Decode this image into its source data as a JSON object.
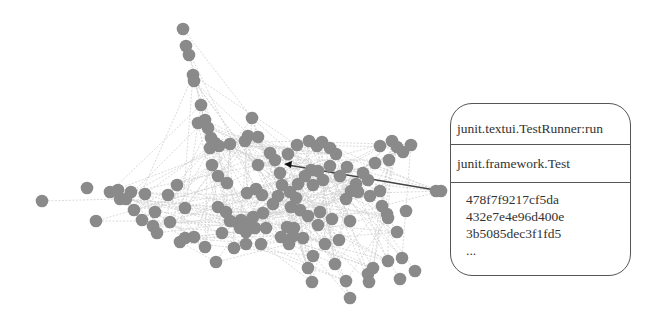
{
  "figure": {
    "node_color": "#8a8a8a",
    "edge_color": "#d0d0d0",
    "highlight_edge_color": "#444444",
    "highlight_edge": {
      "from": [
        441,
        191
      ],
      "to": [
        284,
        164
      ]
    }
  },
  "callout": {
    "method": "junit.textui.TestRunner:run",
    "class": "junit.framework.Test",
    "hashes": [
      "478f7f9217cf5da",
      "432e7e4e96d400e",
      "3b5085dec3f1fd5"
    ],
    "more": "..."
  },
  "nodes": [
    [
      183,
      29
    ],
    [
      186,
      46
    ],
    [
      189,
      55
    ],
    [
      193,
      75
    ],
    [
      194,
      81
    ],
    [
      201,
      105
    ],
    [
      205,
      120
    ],
    [
      208,
      128
    ],
    [
      211,
      138
    ],
    [
      215,
      143
    ],
    [
      219,
      146
    ],
    [
      230,
      144
    ],
    [
      245,
      141
    ],
    [
      248,
      136
    ],
    [
      258,
      137
    ],
    [
      252,
      118
    ],
    [
      198,
      123
    ],
    [
      210,
      148
    ],
    [
      42,
      201
    ],
    [
      87,
      188
    ],
    [
      96,
      221
    ],
    [
      110,
      192
    ],
    [
      118,
      190
    ],
    [
      120,
      199
    ],
    [
      126,
      199
    ],
    [
      131,
      192
    ],
    [
      145,
      194
    ],
    [
      134,
      210
    ],
    [
      177,
      185
    ],
    [
      168,
      195
    ],
    [
      142,
      220
    ],
    [
      155,
      212
    ],
    [
      185,
      208
    ],
    [
      170,
      222
    ],
    [
      180,
      242
    ],
    [
      185,
      238
    ],
    [
      194,
      237
    ],
    [
      218,
      207
    ],
    [
      226,
      212
    ],
    [
      230,
      221
    ],
    [
      241,
      220
    ],
    [
      249,
      222
    ],
    [
      253,
      217
    ],
    [
      246,
      232
    ],
    [
      227,
      183
    ],
    [
      247,
      193
    ],
    [
      256,
      189
    ],
    [
      262,
      195
    ],
    [
      218,
      176
    ],
    [
      212,
      165
    ],
    [
      258,
      165
    ],
    [
      275,
      160
    ],
    [
      280,
      173
    ],
    [
      282,
      185
    ],
    [
      270,
      153
    ],
    [
      288,
      154
    ],
    [
      297,
      145
    ],
    [
      309,
      141
    ],
    [
      317,
      146
    ],
    [
      322,
      142
    ],
    [
      330,
      148
    ],
    [
      336,
      154
    ],
    [
      330,
      166
    ],
    [
      318,
      171
    ],
    [
      311,
      170
    ],
    [
      305,
      176
    ],
    [
      298,
      184
    ],
    [
      290,
      192
    ],
    [
      278,
      196
    ],
    [
      273,
      204
    ],
    [
      263,
      213
    ],
    [
      291,
      207
    ],
    [
      300,
      210
    ],
    [
      308,
      216
    ],
    [
      320,
      212
    ],
    [
      332,
      219
    ],
    [
      346,
      199
    ],
    [
      351,
      191
    ],
    [
      356,
      184
    ],
    [
      368,
      180
    ],
    [
      363,
      173
    ],
    [
      375,
      163
    ],
    [
      389,
      160
    ],
    [
      380,
      146
    ],
    [
      392,
      141
    ],
    [
      397,
      147
    ],
    [
      403,
      152
    ],
    [
      411,
      145
    ],
    [
      406,
      211
    ],
    [
      382,
      206
    ],
    [
      387,
      214
    ],
    [
      397,
      232
    ],
    [
      388,
      218
    ],
    [
      339,
      240
    ],
    [
      325,
      244
    ],
    [
      303,
      238
    ],
    [
      293,
      236
    ],
    [
      261,
      244
    ],
    [
      246,
      244
    ],
    [
      234,
      248
    ],
    [
      216,
      262
    ],
    [
      205,
      247
    ],
    [
      153,
      226
    ],
    [
      157,
      233
    ],
    [
      222,
      233
    ],
    [
      238,
      223
    ],
    [
      240,
      228
    ],
    [
      318,
      225
    ],
    [
      350,
      221
    ],
    [
      380,
      191
    ],
    [
      370,
      196
    ],
    [
      358,
      192
    ],
    [
      340,
      176
    ],
    [
      347,
      167
    ],
    [
      323,
      180
    ],
    [
      313,
      185
    ],
    [
      296,
      198
    ],
    [
      287,
      227
    ],
    [
      294,
      228
    ],
    [
      255,
      228
    ],
    [
      266,
      228
    ],
    [
      281,
      237
    ],
    [
      289,
      244
    ],
    [
      313,
      256
    ],
    [
      308,
      268
    ],
    [
      312,
      282
    ],
    [
      335,
      264
    ],
    [
      346,
      281
    ],
    [
      350,
      298
    ],
    [
      368,
      274
    ],
    [
      373,
      268
    ],
    [
      369,
      282
    ],
    [
      388,
      261
    ],
    [
      402,
      258
    ],
    [
      415,
      271
    ],
    [
      400,
      279
    ],
    [
      436,
      191
    ],
    [
      441,
      191
    ]
  ]
}
